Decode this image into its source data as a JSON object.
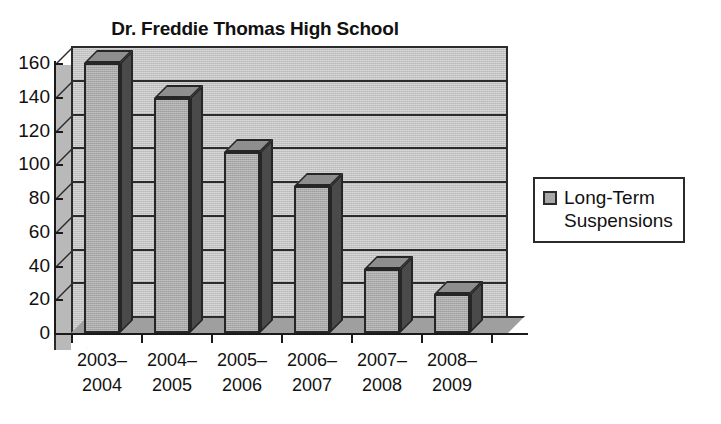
{
  "chart_data": {
    "type": "bar",
    "title": "Dr. Freddie Thomas High School",
    "xlabel": "",
    "ylabel": "",
    "categories": [
      "2003–\n2004",
      "2004–\n2005",
      "2005–\n2006",
      "2006–\n2007",
      "2007–\n2008",
      "2008–\n2009"
    ],
    "category_lines": [
      [
        "2003–",
        "2004"
      ],
      [
        "2004–",
        "2005"
      ],
      [
        "2005–",
        "2006"
      ],
      [
        "2006–",
        "2007"
      ],
      [
        "2007–",
        "2008"
      ],
      [
        "2008–",
        "2009"
      ]
    ],
    "series": [
      {
        "name": "Long-Term Suspensions",
        "values": [
          160,
          139,
          107,
          87,
          38,
          23
        ],
        "color": "#a8a8a8"
      }
    ],
    "values": [
      160,
      139,
      107,
      87,
      38,
      23
    ],
    "ylim": [
      0,
      160
    ],
    "ytick_step": 20,
    "ytick_labels": [
      "160",
      "140",
      "120",
      "100",
      "80",
      "60",
      "40",
      "20",
      "0"
    ],
    "ytick_values": [
      160,
      140,
      120,
      100,
      80,
      60,
      40,
      20,
      0
    ],
    "grid": true,
    "grid_axis": "y",
    "legend_position": "right",
    "style_3d": true
  },
  "legend": {
    "swatch_name": "legend-color-swatch",
    "label": "Long-Term\nSuspensions",
    "label_line1": "Long-Term",
    "label_line2": "Suspensions",
    "swatch_color": "#a8a8a8"
  },
  "colors": {
    "bar_face": "#a8a8a8",
    "bar_side": "#4a4a4a",
    "bar_top": "#8e8e8e",
    "plot_background": "#c3c3c3",
    "floor": "#9c9c9c",
    "axis": "#1a1a1a",
    "text": "#111111",
    "page_background": "#ffffff"
  }
}
